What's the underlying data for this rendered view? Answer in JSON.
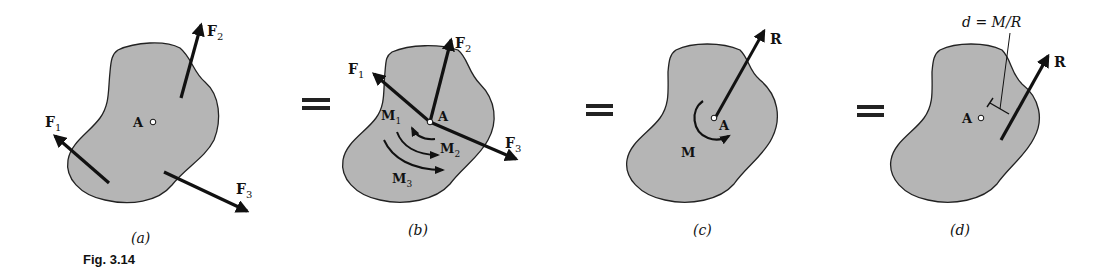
{
  "figure": {
    "caption": "Fig. 3.14",
    "colors": {
      "body_fill": "#b5b5b5",
      "outline": "#222222",
      "vector": "#111111",
      "background": "#ffffff"
    },
    "equals_sign": "="
  },
  "panels": [
    {
      "id": "a",
      "label": "(a)",
      "point": "A",
      "forces": [
        {
          "name": "F",
          "sub": "1"
        },
        {
          "name": "F",
          "sub": "2"
        },
        {
          "name": "F",
          "sub": "3"
        }
      ]
    },
    {
      "id": "b",
      "label": "(b)",
      "point": "A",
      "forces": [
        {
          "name": "F",
          "sub": "1"
        },
        {
          "name": "F",
          "sub": "2"
        },
        {
          "name": "F",
          "sub": "3"
        }
      ],
      "moments": [
        {
          "name": "M",
          "sub": "1"
        },
        {
          "name": "M",
          "sub": "2"
        },
        {
          "name": "M",
          "sub": "3"
        }
      ]
    },
    {
      "id": "c",
      "label": "(c)",
      "point": "A",
      "resultant": "R",
      "moment": "M"
    },
    {
      "id": "d",
      "label": "(d)",
      "point": "A",
      "resultant": "R",
      "distance_annotation": "d = M/R"
    }
  ]
}
